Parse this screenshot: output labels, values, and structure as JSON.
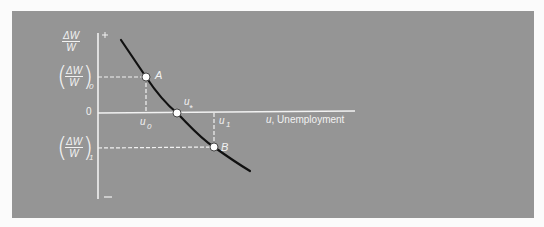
{
  "figure": {
    "background_color": "#959595",
    "foreground_color": "#f2f2f2",
    "curve_color": "#111111",
    "y_axis": {
      "label_numerator": "ΔW",
      "label_denominator": "W",
      "plus_sign": "+",
      "minus_sign": "–",
      "zero_label": "0"
    },
    "x_axis": {
      "label_var": "u",
      "label_text": ", Unemployment"
    },
    "levels": {
      "y0": {
        "numerator": "ΔW",
        "denominator": "W",
        "subscript": "0"
      },
      "y1": {
        "numerator": "ΔW",
        "denominator": "W",
        "subscript": "1"
      }
    },
    "ticks": {
      "u0": {
        "var": "u",
        "subscript": "0"
      },
      "u1": {
        "var": "u",
        "subscript": "1"
      },
      "ustar": {
        "var": "u",
        "subscript": "*"
      }
    },
    "points": [
      {
        "id": "A",
        "label": "A",
        "x": 146,
        "y": 77
      },
      {
        "id": "ustar",
        "label": "",
        "x": 177,
        "y": 113
      },
      {
        "id": "B",
        "label": "B",
        "x": 214,
        "y": 147
      }
    ]
  }
}
